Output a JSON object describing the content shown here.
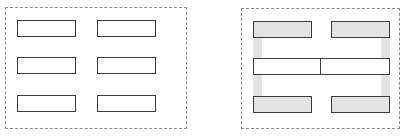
{
  "figure": {
    "type": "diagram",
    "title": "",
    "background_color": "#ffffff",
    "width": 408,
    "height": 137,
    "panel_border_color": "#8a8a8a",
    "panel_border_style": "dashed",
    "box_outline_color": "#3a3a3a",
    "box_fill_unselected": "#ffffff",
    "box_fill_selected": "#e3e3e3",
    "connector_fill": "#e3e3e3"
  },
  "panels": [
    {
      "id": "left",
      "label": "",
      "caption": "",
      "x": 5,
      "y": 7,
      "width": 182,
      "height": 122,
      "description": "six separate rectangles arranged in two columns of three rows, no grouping",
      "boxes": [
        {
          "id": "l-r1c1",
          "x": 11,
          "y": 12,
          "width": 59,
          "height": 17,
          "filled": false
        },
        {
          "id": "l-r1c2",
          "x": 91,
          "y": 12,
          "width": 59,
          "height": 17,
          "filled": false
        },
        {
          "id": "l-r2c1",
          "x": 11,
          "y": 49,
          "width": 59,
          "height": 17,
          "filled": false
        },
        {
          "id": "l-r2c2",
          "x": 91,
          "y": 49,
          "width": 59,
          "height": 17,
          "filled": false
        },
        {
          "id": "l-r3c1",
          "x": 11,
          "y": 87,
          "width": 59,
          "height": 17,
          "filled": false
        },
        {
          "id": "l-r3c2",
          "x": 91,
          "y": 87,
          "width": 59,
          "height": 17,
          "filled": false
        }
      ],
      "connectors": []
    },
    {
      "id": "right",
      "label": "",
      "caption": "",
      "x": 241,
      "y": 8,
      "width": 159,
      "height": 121,
      "description": "the same six rectangles shaded grey and joined by grey spines so that the left column forms an E glyph and the right column forms a mirrored E glyph",
      "glyphs": [
        {
          "id": "glyph-e",
          "shape": "E",
          "side": "left",
          "spine_side": "left"
        },
        {
          "id": "glyph-e-mirrored",
          "shape": "Ǝ",
          "side": "right",
          "spine_side": "right"
        }
      ],
      "connectors": [
        {
          "id": "spine-left",
          "belongs_to": "glyph-e",
          "x": 11,
          "y": 12,
          "width": 9,
          "height": 92
        },
        {
          "id": "spine-right",
          "belongs_to": "glyph-e-mirrored",
          "x": 139,
          "y": 12,
          "width": 9,
          "height": 92
        }
      ],
      "boxes": [
        {
          "id": "r-r1c1",
          "x": 11,
          "y": 12,
          "width": 59,
          "height": 17,
          "filled": true,
          "over": false
        },
        {
          "id": "r-r1c2",
          "x": 89,
          "y": 12,
          "width": 59,
          "height": 17,
          "filled": true,
          "over": false
        },
        {
          "id": "r-r2c1",
          "x": 11,
          "y": 49,
          "width": 70,
          "height": 17,
          "filled": false,
          "over": true
        },
        {
          "id": "r-r2c2",
          "x": 78,
          "y": 49,
          "width": 70,
          "height": 17,
          "filled": false,
          "over": true
        },
        {
          "id": "r-r3c1",
          "x": 11,
          "y": 87,
          "width": 59,
          "height": 17,
          "filled": true,
          "over": false
        },
        {
          "id": "r-r3c2",
          "x": 89,
          "y": 87,
          "width": 59,
          "height": 17,
          "filled": true,
          "over": false
        }
      ]
    }
  ]
}
